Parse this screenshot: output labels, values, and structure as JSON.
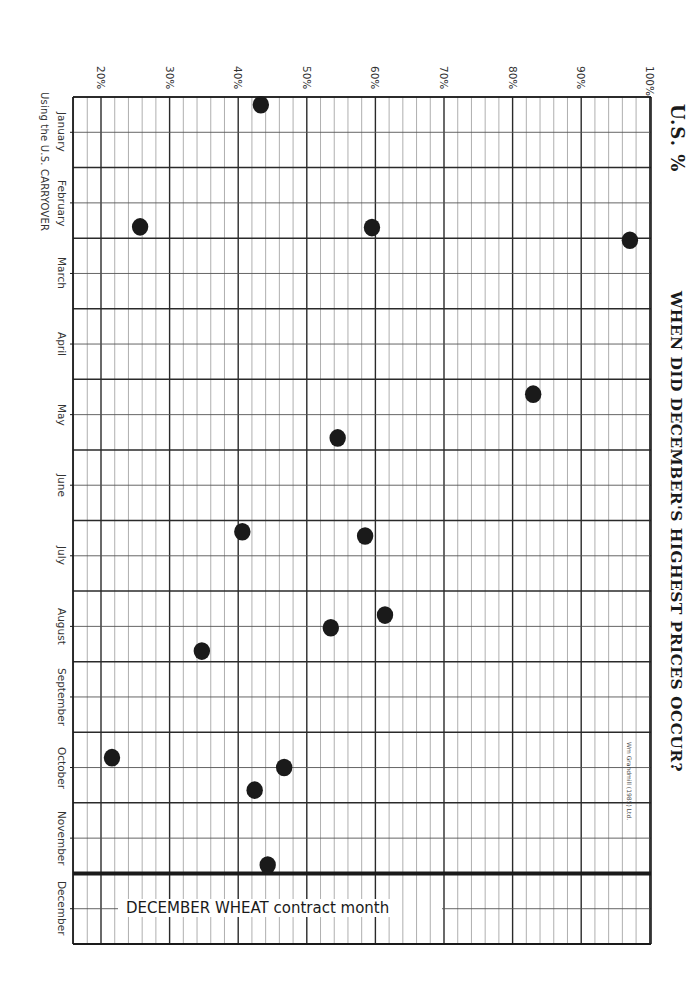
{
  "title": "WHEN DID DECEMBER'S HIGHEST PRICES OCCUR?",
  "axis_title": "U.S. %",
  "subtitle": "Using the U.S. CARRYOVER",
  "credit": "Wm Grandmill (1985) Ltd.",
  "contract_label": "DECEMBER WHEAT contract month",
  "colors": {
    "ink": "#1a1a1a",
    "grid_minor": "#9a9a9a",
    "grid_major": "#2a2a2a",
    "paper": "#ffffff"
  },
  "chart_data": {
    "type": "scatter",
    "orientation": "rotated 90deg clockwise (months run top-to-bottom on left edge, percent runs left-to-right on top edge)",
    "title": "WHEN DID DECEMBER'S HIGHEST PRICES OCCUR?",
    "xlabel": "Month of contract high (Using the U.S. CARRYOVER)",
    "ylabel": "U.S. %",
    "x_categories": [
      "January",
      "February",
      "March",
      "April",
      "May",
      "June",
      "July",
      "August",
      "September",
      "October",
      "November",
      "December"
    ],
    "y_ticks": [
      "20%",
      "30%",
      "40%",
      "50%",
      "60%",
      "70%",
      "80%",
      "90%",
      "100%"
    ],
    "y_tick_values": [
      20,
      30,
      40,
      50,
      60,
      70,
      80,
      90,
      100
    ],
    "ylim": [
      16,
      100
    ],
    "y_minor_step": 2,
    "x_subdivisions_per_month": 2,
    "annotations": [
      {
        "text": "DECEMBER WHEAT contract month",
        "month": "December"
      },
      {
        "text": "Wm Grandmill (1985) Ltd.",
        "position": "near 100% edge, October-November"
      }
    ],
    "grid": true,
    "points": [
      {
        "month_pos": 0.11,
        "month": "January",
        "pct": 43.3
      },
      {
        "month_pos": 1.84,
        "month": "February",
        "pct": 25.7
      },
      {
        "month_pos": 1.85,
        "month": "February",
        "pct": 59.5
      },
      {
        "month_pos": 2.03,
        "month": "March",
        "pct": 97.1
      },
      {
        "month_pos": 4.21,
        "month": "May",
        "pct": 83.0
      },
      {
        "month_pos": 4.83,
        "month": "May",
        "pct": 54.5
      },
      {
        "month_pos": 6.16,
        "month": "July",
        "pct": 40.6
      },
      {
        "month_pos": 6.22,
        "month": "July",
        "pct": 58.5
      },
      {
        "month_pos": 7.34,
        "month": "August",
        "pct": 61.4
      },
      {
        "month_pos": 7.52,
        "month": "August",
        "pct": 53.5
      },
      {
        "month_pos": 7.85,
        "month": "August",
        "pct": 34.7
      },
      {
        "month_pos": 9.36,
        "month": "October",
        "pct": 21.6
      },
      {
        "month_pos": 9.5,
        "month": "October",
        "pct": 46.7
      },
      {
        "month_pos": 9.82,
        "month": "October",
        "pct": 42.4
      },
      {
        "month_pos": 10.88,
        "month": "November",
        "pct": 44.3
      }
    ]
  }
}
